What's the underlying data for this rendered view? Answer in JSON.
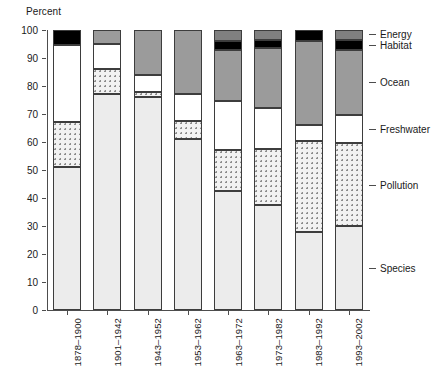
{
  "chart_data": {
    "type": "bar",
    "stacked": true,
    "title": "",
    "xlabel": "",
    "ylabel": "Percent",
    "ylim": [
      0,
      100
    ],
    "ytick_step": 10,
    "yticks": [
      0,
      10,
      20,
      30,
      40,
      50,
      60,
      70,
      80,
      90,
      100
    ],
    "grid": true,
    "legend_position": "right",
    "categories": [
      "1878-1900",
      "1901-1942",
      "1943-1952",
      "1953-1962",
      "1963-1972",
      "1973-1982",
      "1983-1992",
      "1993-2002"
    ],
    "series": [
      {
        "name": "Species",
        "fill": "light-gray-solid",
        "color": "#ececec",
        "values": [
          51,
          77,
          76,
          61,
          42.5,
          37.5,
          28,
          30
        ]
      },
      {
        "name": "Pollution",
        "fill": "dotted",
        "color": "#f2f2f2",
        "values": [
          16,
          9,
          2,
          6.5,
          14.5,
          20,
          32.5,
          29.5
        ]
      },
      {
        "name": "Freshwater",
        "fill": "white-solid",
        "color": "#ffffff",
        "values": [
          27.5,
          9,
          6,
          9.5,
          17.5,
          14.5,
          5.5,
          10
        ]
      },
      {
        "name": "Ocean",
        "fill": "mid-gray-solid",
        "color": "#9b9b9b",
        "values": [
          0,
          5,
          16,
          23,
          18.5,
          21.5,
          30,
          23.5
        ]
      },
      {
        "name": "Habitat",
        "fill": "black-solid",
        "color": "#000000",
        "values": [
          5.5,
          0,
          0,
          0,
          3,
          3,
          4,
          3.5
        ]
      },
      {
        "name": "Energy",
        "fill": "gray-solid",
        "color": "#808080",
        "values": [
          0,
          0,
          0,
          0,
          4,
          3.5,
          0,
          3.5
        ]
      }
    ],
    "legend_entries": [
      {
        "label": "Energy",
        "anchor_value": 98.5
      },
      {
        "label": "Habitat",
        "anchor_value": 94.8
      },
      {
        "label": "Ocean",
        "anchor_value": 81.5
      },
      {
        "label": "Freshwater",
        "anchor_value": 64.5
      },
      {
        "label": "Pollution",
        "anchor_value": 44.5
      },
      {
        "label": "Species",
        "anchor_value": 15.0
      }
    ]
  }
}
